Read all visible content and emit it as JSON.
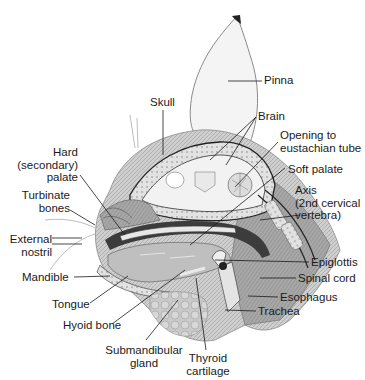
{
  "figure": {
    "labels": [
      {
        "id": "pinna",
        "text": "Pinna",
        "x": 264,
        "y": 73,
        "align": "l"
      },
      {
        "id": "skull",
        "text": "Skull",
        "x": 150,
        "y": 96,
        "align": "l"
      },
      {
        "id": "brain",
        "text": "Brain",
        "x": 258,
        "y": 110,
        "align": "l"
      },
      {
        "id": "opening",
        "text": "Opening to\neustachian tube",
        "x": 280,
        "y": 128,
        "align": "l"
      },
      {
        "id": "hard-palate",
        "text": "Hard\n(secondary)\npalate",
        "x": 2,
        "y": 145,
        "w": 76,
        "align": "r"
      },
      {
        "id": "soft-palate",
        "text": "Soft palate",
        "x": 288,
        "y": 163,
        "align": "l"
      },
      {
        "id": "axis",
        "text": "Axis\n(2nd cervical\nvertebra)",
        "x": 295,
        "y": 183,
        "align": "l"
      },
      {
        "id": "turbinate",
        "text": "Turbinate\nbones",
        "x": 2,
        "y": 188,
        "w": 68,
        "align": "r"
      },
      {
        "id": "external-nostril",
        "text": "External\nnostril",
        "x": 2,
        "y": 233,
        "w": 52,
        "align": "r"
      },
      {
        "id": "epiglottis",
        "text": "Epiglottis",
        "x": 311,
        "y": 256,
        "align": "l"
      },
      {
        "id": "mandible",
        "text": "Mandible",
        "x": 22,
        "y": 270,
        "align": "l"
      },
      {
        "id": "spinal-cord",
        "text": "Spinal cord",
        "x": 298,
        "y": 272,
        "align": "l"
      },
      {
        "id": "esophagus",
        "text": "Esophagus",
        "x": 280,
        "y": 290,
        "align": "l"
      },
      {
        "id": "tongue",
        "text": "Tongue",
        "x": 52,
        "y": 297,
        "align": "l"
      },
      {
        "id": "trachea",
        "text": "Trachea",
        "x": 258,
        "y": 306,
        "align": "l"
      },
      {
        "id": "hyoid",
        "text": "Hyoid bone",
        "x": 63,
        "y": 319,
        "align": "l"
      },
      {
        "id": "submandibular",
        "text": "Submandibular\ngland",
        "x": 104,
        "y": 343,
        "w": 80,
        "align": "c"
      },
      {
        "id": "thyroid",
        "text": "Thyroid\ncartilage",
        "x": 182,
        "y": 352,
        "w": 60,
        "align": "c"
      }
    ]
  },
  "colors": {
    "ink": "#1a1a1a",
    "skin": "#b9b9b9",
    "tissue": "#8a8a8a",
    "dark": "#3a3a3a",
    "bone": "#d9d9d9",
    "pale": "#efefef"
  }
}
